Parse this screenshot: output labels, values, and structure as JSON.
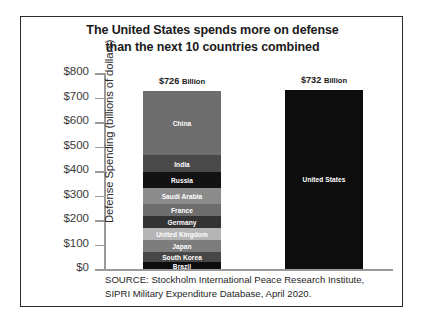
{
  "chart_data": {
    "type": "bar",
    "title": "The United States spends more on defense than the next 10 countries combined",
    "title_lines": [
      "The United States spends more on defense",
      "than the next 10 countries combined"
    ],
    "xlabel": "",
    "ylabel": "Defense Spending (billions of dollars)",
    "ylim": [
      0,
      800
    ],
    "yticks": [
      800,
      700,
      600,
      500,
      400,
      300,
      200,
      100,
      0
    ],
    "ytick_labels": [
      "$800",
      "$700",
      "$600",
      "$500",
      "$400",
      "$300",
      "$200",
      "$100",
      "$0"
    ],
    "grid": false,
    "legend": "none",
    "stacked": true,
    "categories": [
      "Next 10 countries combined",
      "United States"
    ],
    "bars": [
      {
        "name": "next-10-combined",
        "total": 726,
        "total_label": "$726",
        "total_label_unit": "Billion",
        "segments": [
          {
            "label": "China",
            "value": 261,
            "color": "#6e6e6e"
          },
          {
            "label": "India",
            "value": 71,
            "color": "#4a4a4a"
          },
          {
            "label": "Russia",
            "value": 65,
            "color": "#121212"
          },
          {
            "label": "Saudi Arabia",
            "value": 62,
            "color": "#8c8c8c"
          },
          {
            "label": "France",
            "value": 50,
            "color": "#6e6e6e"
          },
          {
            "label": "Germany",
            "value": 49,
            "color": "#333333"
          },
          {
            "label": "United Kingdom",
            "value": 49,
            "color": "#b5b5b5"
          },
          {
            "label": "Japan",
            "value": 48,
            "color": "#7d7d7d"
          },
          {
            "label": "South Korea",
            "value": 44,
            "color": "#474747"
          },
          {
            "label": "Brazil",
            "value": 27,
            "color": "#0d0d0d"
          }
        ]
      },
      {
        "name": "united-states",
        "total": 732,
        "total_label": "$732",
        "total_label_unit": "Billion",
        "segments": [
          {
            "label": "United States",
            "value": 732,
            "color": "#0d0d0d"
          }
        ]
      }
    ],
    "source_lines": [
      "SOURCE: Stockholm International Peace Research Institute,",
      "SIPRI Military Expenditure Database, April 2020."
    ],
    "colors": {
      "frame_border": "#2b2b2b",
      "axis": "#9a9a9a",
      "text": "#1a1a1a",
      "background": "#ffffff"
    }
  }
}
